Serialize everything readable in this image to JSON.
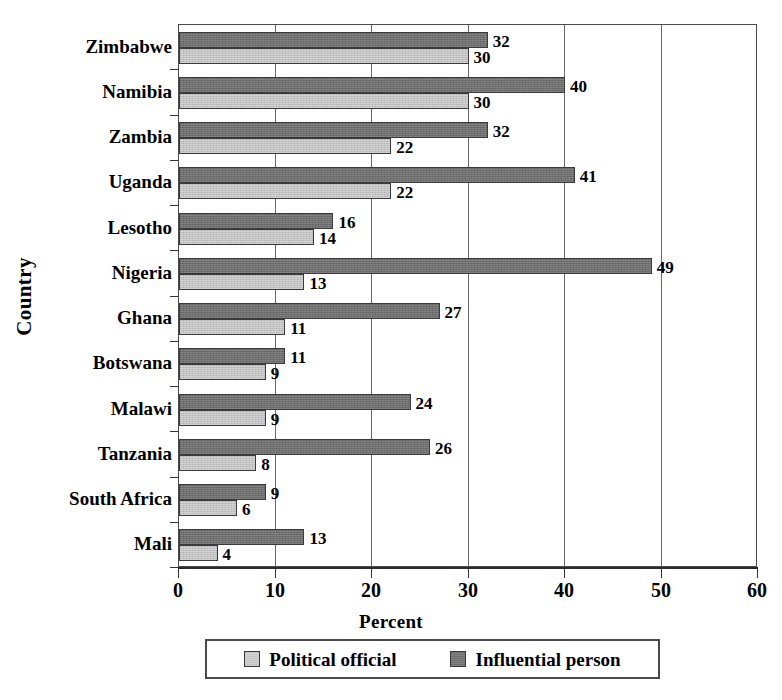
{
  "chart_data": {
    "type": "bar",
    "orientation": "horizontal",
    "title": "",
    "xlabel": "Percent",
    "ylabel": "Country",
    "xlim": [
      0,
      60
    ],
    "xticks": [
      0,
      10,
      20,
      30,
      40,
      50,
      60
    ],
    "grid": "vertical",
    "legend_position": "bottom",
    "categories": [
      "Zimbabwe",
      "Namibia",
      "Zambia",
      "Uganda",
      "Lesotho",
      "Nigeria",
      "Ghana",
      "Botswana",
      "Malawi",
      "Tanzania",
      "South Africa",
      "Mali"
    ],
    "series": [
      {
        "name": "Political official",
        "color": "#c2c2c2",
        "values": [
          30,
          30,
          22,
          22,
          14,
          13,
          11,
          9,
          9,
          8,
          6,
          4
        ]
      },
      {
        "name": "Influential person",
        "color": "#6e6e6e",
        "values": [
          32,
          40,
          32,
          41,
          16,
          49,
          27,
          11,
          24,
          26,
          9,
          13
        ]
      }
    ]
  },
  "legend": {
    "items": [
      {
        "label": "Political official",
        "swatch": "light"
      },
      {
        "label": "Influential person",
        "swatch": "dark"
      }
    ]
  }
}
